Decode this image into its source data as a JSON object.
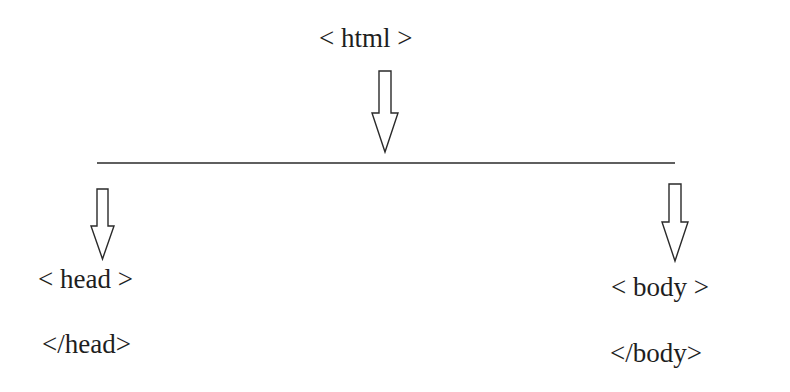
{
  "diagram": {
    "root": {
      "label": "< html >"
    },
    "children": [
      {
        "id": "head",
        "open_tag": "< head >",
        "close_tag": "</head>"
      },
      {
        "id": "body",
        "open_tag": "< body >",
        "close_tag": "</body>"
      }
    ],
    "colors": {
      "stroke": "#2a2a2a",
      "text": "#1e1e1e",
      "background": "#ffffff"
    }
  }
}
